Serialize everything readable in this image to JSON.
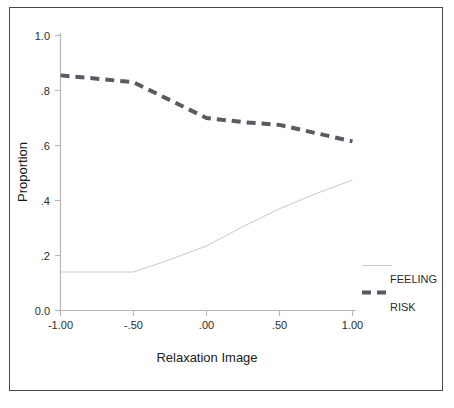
{
  "chart_data": {
    "type": "line",
    "title": "",
    "xlabel": "Relaxation Image",
    "ylabel": "Proportion",
    "xlim": [
      -1.0,
      1.0
    ],
    "ylim": [
      0.0,
      1.0
    ],
    "grid": false,
    "legend_position": "right-outside",
    "x_tick_labels": [
      "-1.00",
      "-.50",
      ".00",
      ".50",
      "1.00"
    ],
    "x_ticks": [
      -1.0,
      -0.5,
      0.0,
      0.5,
      1.0
    ],
    "y_tick_labels": [
      "0.0",
      ".2",
      ".4",
      ".6",
      ".8",
      "1.0"
    ],
    "y_ticks": [
      0.0,
      0.2,
      0.4,
      0.6,
      0.8,
      1.0
    ],
    "series": [
      {
        "name": "FEELING",
        "style": "solid",
        "color": "#c9c9c9",
        "width": 1,
        "x": [
          -1.0,
          -0.75,
          -0.5,
          -0.25,
          0.0,
          0.25,
          0.5,
          0.75,
          1.0
        ],
        "values": [
          0.14,
          0.14,
          0.14,
          0.185,
          0.235,
          0.305,
          0.37,
          0.425,
          0.475
        ]
      },
      {
        "name": "RISK",
        "style": "dashed",
        "color": "#5a5a62",
        "width": 4,
        "x": [
          -1.0,
          -0.75,
          -0.5,
          -0.25,
          0.0,
          0.25,
          0.5,
          0.75,
          1.0
        ],
        "values": [
          0.855,
          0.843,
          0.83,
          0.765,
          0.7,
          0.685,
          0.675,
          0.645,
          0.615
        ]
      }
    ],
    "legend_entries": [
      {
        "label": "FEELING",
        "style": "solid",
        "color": "#c9c9c9"
      },
      {
        "label": "RISK",
        "style": "dashed",
        "color": "#5a5a62"
      }
    ]
  },
  "axes": {
    "y_title": "Proportion",
    "x_title": "Relaxation Image"
  },
  "legend": {
    "feeling_label": "FEELING",
    "risk_label": "RISK"
  },
  "ticks": {
    "y": [
      "1.0",
      ".8",
      ".6",
      ".4",
      ".2",
      "0.0"
    ],
    "x": [
      "-1.00",
      "-.50",
      ".00",
      ".50",
      "1.00"
    ]
  }
}
